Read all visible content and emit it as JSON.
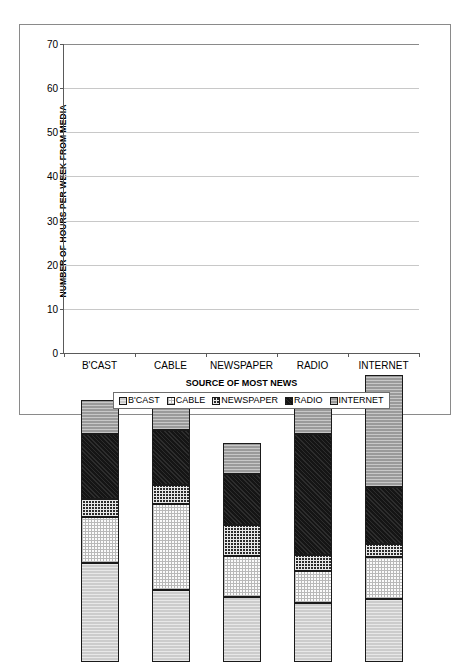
{
  "chart_data": {
    "type": "bar",
    "subtype": "stacked-column",
    "title": "",
    "xlabel": "SOURCE OF MOST NEWS",
    "ylabel": "NUMBER OF HOURS PER WEEK FROM MEDIA",
    "categories": [
      "B'CAST",
      "CABLE",
      "NEWSPAPER",
      "RADIO",
      "INTERNET"
    ],
    "series": [
      {
        "name": "B'CAST",
        "values": [
          22.5,
          16.2,
          14.8,
          13.4,
          14.3
        ]
      },
      {
        "name": "CABLE",
        "values": [
          10.3,
          19.6,
          9.2,
          7.3,
          9.4
        ]
      },
      {
        "name": "NEWSPAPER",
        "values": [
          4.2,
          4.3,
          7.0,
          3.6,
          3.1
        ]
      },
      {
        "name": "RADIO",
        "values": [
          14.6,
          12.5,
          11.5,
          27.4,
          12.9
        ]
      },
      {
        "name": "INTERNET",
        "values": [
          7.8,
          8.1,
          7.2,
          6.9,
          25.3
        ]
      }
    ],
    "totals": [
      59.4,
      60.7,
      49.7,
      58.6,
      65.0
    ],
    "ylim": [
      0,
      70
    ],
    "yticks": [
      0,
      10,
      20,
      30,
      40,
      50,
      60,
      70
    ],
    "grid": "horizontal",
    "legend_position": "bottom",
    "legend": [
      "B'CAST",
      "CABLE",
      "NEWSPAPER",
      "RADIO",
      "INTERNET"
    ]
  },
  "legend": {
    "items": [
      {
        "label": "B'CAST"
      },
      {
        "label": "CABLE"
      },
      {
        "label": "NEWSPAPER"
      },
      {
        "label": "RADIO"
      },
      {
        "label": "INTERNET"
      }
    ]
  },
  "colors": {
    "bcast": "#cccccc",
    "cable": "#fbfbfb",
    "newspaper": "#2b2b2b",
    "radio": "#151515",
    "internet": "#9a9a9a",
    "gridline": "#c8c8c8",
    "axis": "#5a5a5a",
    "frame": "#8a8a8a",
    "text": "#000000"
  }
}
